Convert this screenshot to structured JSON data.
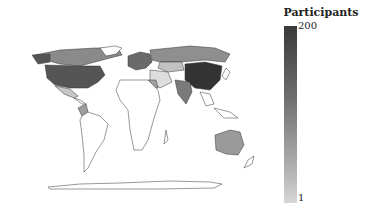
{
  "legend": {
    "title": "Participants",
    "max_label": "200",
    "min_label": "1",
    "color_high": "#3a3a3a",
    "color_low": "#d6d6d6"
  },
  "map": {
    "projection": "world",
    "regions": [
      {
        "name": "United States",
        "shade": "#555555"
      },
      {
        "name": "China",
        "shade": "#333333"
      },
      {
        "name": "Canada",
        "shade": "#8a8a8a"
      },
      {
        "name": "Russia",
        "shade": "#8f8f8f"
      },
      {
        "name": "India",
        "shade": "#7a7a7a"
      },
      {
        "name": "Australia",
        "shade": "#9a9a9a"
      },
      {
        "name": "Mexico",
        "shade": "#c8c8c8"
      },
      {
        "name": "Colombia",
        "shade": "#9e9e9e"
      },
      {
        "name": "Europe",
        "shade": "#6a6a6a"
      },
      {
        "name": "Kazakhstan",
        "shade": "#c2c2c2"
      },
      {
        "name": "Egypt",
        "shade": "#a0a0a0"
      }
    ]
  }
}
